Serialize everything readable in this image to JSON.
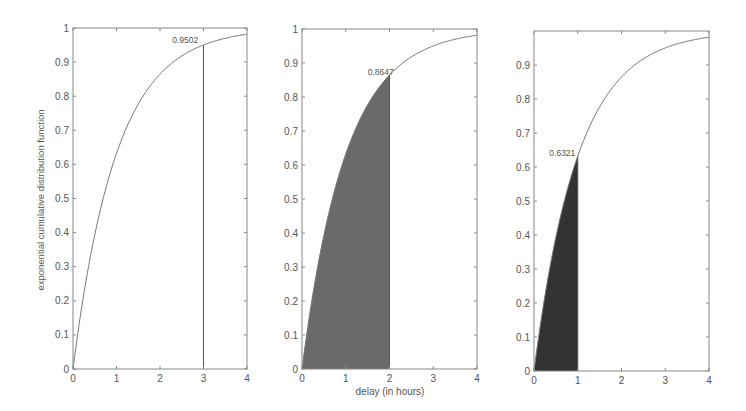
{
  "chart_data": [
    {
      "type": "area",
      "title": "",
      "xlabel": "",
      "ylabel": "exponential cumulative distribution function",
      "xlim": [
        0,
        4
      ],
      "ylim": [
        0,
        1
      ],
      "xticks": [
        "0",
        "1",
        "2",
        "3",
        "4"
      ],
      "yticks": [
        "0",
        "0.1",
        "0.2",
        "0.3",
        "0.4",
        "0.5",
        "0.6",
        "0.7",
        "0.8",
        "0.9",
        "1"
      ],
      "curve": "F(x) = 1 - exp(-x)",
      "x": [
        0,
        0.5,
        1,
        1.5,
        2,
        2.5,
        3,
        3.5,
        4
      ],
      "values": [
        0,
        0.3935,
        0.6321,
        0.7769,
        0.8647,
        0.9179,
        0.9502,
        0.9698,
        0.9817
      ],
      "marker_x": 3,
      "shade_to": 3,
      "shading": "none (vertical line only)",
      "annotation": "0.9502",
      "grid": false
    },
    {
      "type": "area",
      "title": "",
      "xlabel": "delay (in hours)",
      "ylabel": "",
      "xlim": [
        0,
        4
      ],
      "ylim": [
        0,
        1
      ],
      "xticks": [
        "0",
        "1",
        "2",
        "3",
        "4"
      ],
      "yticks": [
        "0",
        "0.1",
        "0.2",
        "0.3",
        "0.4",
        "0.5",
        "0.6",
        "0.7",
        "0.8",
        "0.9",
        "1"
      ],
      "curve": "F(x) = 1 - exp(-x)",
      "x": [
        0,
        0.5,
        1,
        1.5,
        2,
        2.5,
        3,
        3.5,
        4
      ],
      "values": [
        0,
        0.3935,
        0.6321,
        0.7769,
        0.8647,
        0.9179,
        0.9502,
        0.9698,
        0.9817
      ],
      "marker_x": 2,
      "shade_to": 2,
      "shading": "gray fill under curve from 0 to 2",
      "annotation": "0.8647",
      "grid": false
    },
    {
      "type": "area",
      "title": "",
      "xlabel": "",
      "ylabel": "",
      "xlim": [
        0,
        4
      ],
      "ylim": [
        0,
        1
      ],
      "xticks": [
        "0",
        "1",
        "2",
        "3",
        "4"
      ],
      "yticks": [
        "0",
        "0.1",
        "0.2",
        "0.3",
        "0.4",
        "0.5",
        "0.6",
        "0.7",
        "0.8",
        "0.9"
      ],
      "curve": "F(x) = 1 - exp(-x)",
      "x": [
        0,
        0.5,
        1,
        1.5,
        2,
        2.5,
        3,
        3.5,
        4
      ],
      "values": [
        0,
        0.3935,
        0.6321,
        0.7769,
        0.8647,
        0.9179,
        0.9502,
        0.9698,
        0.9817
      ],
      "marker_x": 1,
      "shade_to": 1,
      "shading": "dark fill under curve from 0 to 1",
      "annotation": "0.6321",
      "grid": false
    }
  ],
  "panels": [
    {
      "box": [
        73,
        28,
        247,
        369
      ],
      "shade_color": "none",
      "line_color": "#666666",
      "show_top_tick": true,
      "annotation": {
        "text": "0.9502",
        "x": 2.28,
        "y": 0.965
      }
    },
    {
      "box": [
        302,
        29,
        477,
        369
      ],
      "shade_color": "#6a6a6a",
      "line_color": "#666666",
      "show_top_tick": true,
      "annotation": {
        "text": "0.8647",
        "x": 1.5,
        "y": 0.875
      }
    },
    {
      "box": [
        534,
        31,
        709,
        371
      ],
      "shade_color": "#333333",
      "line_color": "#666666",
      "show_top_tick": false,
      "annotation": {
        "text": "0.6321",
        "x": 0.35,
        "y": 0.64
      }
    }
  ],
  "colors": {
    "axis": "#888888",
    "curve": "#777777",
    "text": "#555555"
  }
}
